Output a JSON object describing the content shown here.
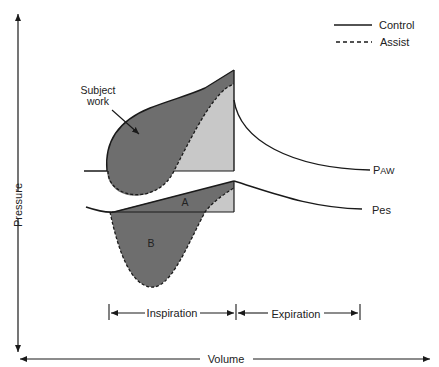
{
  "legend": {
    "items": [
      {
        "label": "Control",
        "style": "solid"
      },
      {
        "label": "Assist",
        "style": "dashed"
      }
    ]
  },
  "axes": {
    "y_label": "Pressure",
    "x_label": "Volume"
  },
  "curves": {
    "paw_label_main": "P",
    "paw_label_sub": "AW",
    "pes_label": "Pes"
  },
  "annotations": {
    "subject_work_line1": "Subject",
    "subject_work_line2": "work",
    "area_a": "A",
    "area_b": "B"
  },
  "phases": {
    "inspiration": "Inspiration",
    "expiration": "Expiration"
  },
  "colors": {
    "dark_fill": "#6e6e6e",
    "light_fill": "#c8c8c8",
    "stroke": "#1a1a1a"
  }
}
